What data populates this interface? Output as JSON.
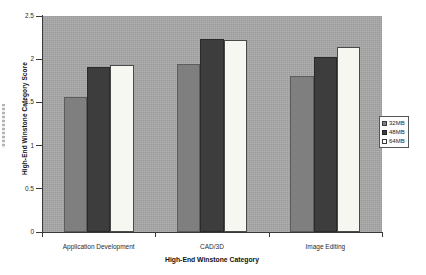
{
  "chart_data": {
    "type": "bar",
    "title": "",
    "xlabel": "High-End Winstone Category",
    "ylabel": "High-End Winstone Category Score",
    "categories": [
      "Application Development",
      "CAD/3D",
      "Image Editing"
    ],
    "series": [
      {
        "name": "32MB",
        "color": "#7f7f7f",
        "values": [
          1.56,
          1.95,
          1.81
        ]
      },
      {
        "name": "48MB",
        "color": "#3d3d3d",
        "values": [
          1.91,
          2.23,
          2.03
        ]
      },
      {
        "name": "64MB",
        "color": "#ffffff",
        "values": [
          1.93,
          2.22,
          2.14
        ]
      }
    ],
    "ylim": [
      0,
      2.5
    ],
    "ytick_labels": [
      "0",
      "0.5",
      "1",
      "1.5",
      "2",
      "2.5"
    ],
    "ytick_values": [
      0,
      0.5,
      1,
      1.5,
      2,
      2.5
    ],
    "grid": false,
    "legend_position": "right-middle",
    "plot_background": "#a9a9a9"
  },
  "legend": {
    "items": [
      {
        "label": "32MB"
      },
      {
        "label": "48MB"
      },
      {
        "label": "64MB"
      }
    ]
  }
}
